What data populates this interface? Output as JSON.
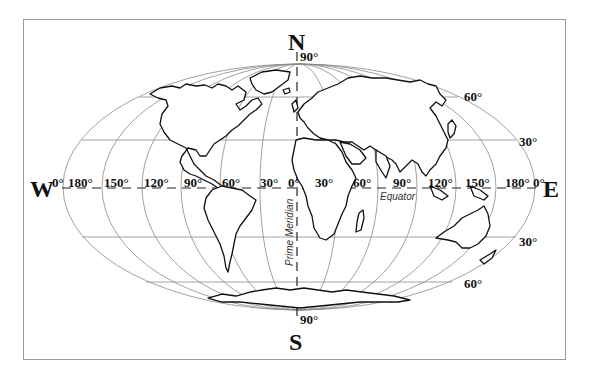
{
  "map": {
    "projection": "Mollweide-style world outline map",
    "cardinals": {
      "north": "N",
      "south": "S",
      "west": "W",
      "east": "E"
    },
    "poles": {
      "north_label": "90°",
      "south_label": "90°"
    },
    "longitude_labels": [
      "0°",
      "180°",
      "150°",
      "120°",
      "90°",
      "60°",
      "30°",
      "0°",
      "30°",
      "60°",
      "90°",
      "120°",
      "150°",
      "180°",
      "0°"
    ],
    "latitude_labels": {
      "n60": "60°",
      "n30": "30°",
      "s30": "30°",
      "s60": "60°"
    },
    "annotations": {
      "equator": "Equator",
      "prime_meridian": "Prime Meridian"
    },
    "colors": {
      "grid": "#8a8a8a",
      "coast": "#111111",
      "frame": "#9a9a9a",
      "text": "#111111"
    }
  }
}
